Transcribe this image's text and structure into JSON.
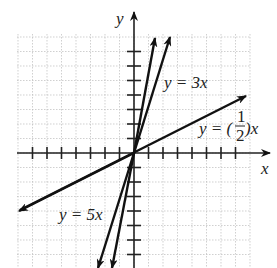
{
  "chart_data": {
    "type": "line",
    "title": "",
    "xlabel": "x",
    "ylabel": "y",
    "grid": true,
    "xlim": [
      -8,
      8
    ],
    "ylim": [
      -8,
      8
    ],
    "series": [
      {
        "name": "y = 5x",
        "slope": 5,
        "label": "y = 5x"
      },
      {
        "name": "y = 3x",
        "slope": 3,
        "label": "y = 3x"
      },
      {
        "name": "y = (1/2)x",
        "slope": 0.5,
        "label": "y = (1/2)x"
      }
    ]
  },
  "labels": {
    "y_axis": "y",
    "x_axis": "x",
    "line_3x": "y = 3x",
    "line_5x": "y = 5x",
    "line_half_prefix": "y = (",
    "line_half_num": "1",
    "line_half_den": "2",
    "line_half_suffix": ")x"
  }
}
